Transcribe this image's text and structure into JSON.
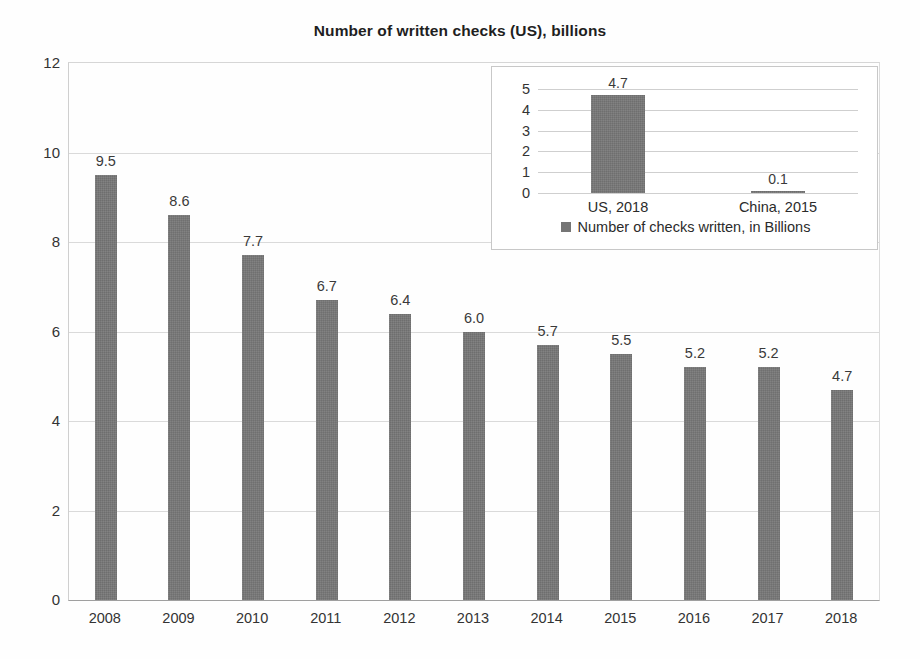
{
  "chart_data": {
    "type": "bar",
    "title": "Number of written checks (US), billions",
    "xlabel": "",
    "ylabel": "",
    "ylim": [
      0,
      12
    ],
    "yticks": [
      0,
      2,
      4,
      6,
      8,
      10,
      12
    ],
    "grid": true,
    "legend_position": "none",
    "categories": [
      "2008",
      "2009",
      "2010",
      "2011",
      "2012",
      "2013",
      "2014",
      "2015",
      "2016",
      "2017",
      "2018"
    ],
    "values": [
      9.5,
      8.6,
      7.7,
      6.7,
      6.4,
      6.0,
      5.7,
      5.5,
      5.2,
      5.2,
      4.7
    ],
    "data_labels": [
      "9.5",
      "8.6",
      "7.7",
      "6.7",
      "6.4",
      "6.0",
      "5.7",
      "5.5",
      "5.2",
      "5.2",
      "4.7"
    ],
    "bar_color": "#757575",
    "inset": {
      "type": "bar",
      "title": "",
      "ylim": [
        0,
        5
      ],
      "yticks": [
        0,
        1,
        2,
        3,
        4,
        5
      ],
      "grid": true,
      "legend_position": "bottom",
      "legend_entries": [
        "Number of checks written, in Billions"
      ],
      "categories": [
        "US, 2018",
        "China, 2015"
      ],
      "values": [
        4.7,
        0.1
      ],
      "data_labels": [
        "4.7",
        "0.1"
      ],
      "bar_color": "#757575"
    }
  },
  "yticks_text": [
    "12",
    "10",
    "8",
    "6",
    "4",
    "2",
    "0"
  ],
  "inset_yticks_text": [
    "5",
    "4",
    "3",
    "2",
    "1",
    "0"
  ],
  "legend": {
    "label": "Number of checks written, in Billions"
  }
}
